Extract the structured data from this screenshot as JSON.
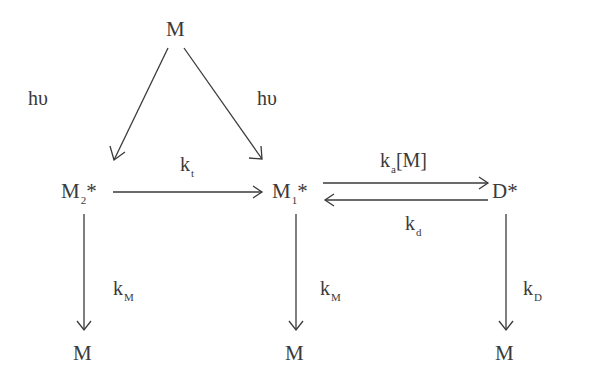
{
  "diagram": {
    "type": "kinetic-scheme",
    "nodes": {
      "ground_top": {
        "label": "M"
      },
      "m2_star": {
        "base": "M",
        "sub": "2",
        "suffix": "*"
      },
      "m1_star": {
        "base": "M",
        "sub": "1",
        "suffix": "*"
      },
      "d_star": {
        "base": "D",
        "suffix": "*"
      },
      "ground_left": {
        "label": "M"
      },
      "ground_mid": {
        "label": "M"
      },
      "ground_right": {
        "label": "M"
      }
    },
    "labels": {
      "hv_left": "hυ",
      "hv_right": "hυ",
      "k_t": {
        "base": "k",
        "sub": "t"
      },
      "k_a": {
        "base": "k",
        "sub": "a",
        "suffix": "[M]"
      },
      "k_d": {
        "base": "k",
        "sub": "d"
      },
      "k_M_left": {
        "base": "k",
        "sub": "M"
      },
      "k_M_mid": {
        "base": "k",
        "sub": "M"
      },
      "k_D": {
        "base": "k",
        "sub": "D"
      }
    },
    "edges": [
      {
        "from": "M",
        "to": "M2*",
        "label": "hυ"
      },
      {
        "from": "M",
        "to": "M1*",
        "label": "hυ"
      },
      {
        "from": "M2*",
        "to": "M1*",
        "label": "k_t"
      },
      {
        "from": "M1*",
        "to": "D*",
        "label": "k_a[M]"
      },
      {
        "from": "D*",
        "to": "M1*",
        "label": "k_d"
      },
      {
        "from": "M2*",
        "to": "M",
        "label": "k_M"
      },
      {
        "from": "M1*",
        "to": "M",
        "label": "k_M"
      },
      {
        "from": "D*",
        "to": "M",
        "label": "k_D"
      }
    ],
    "colors": {
      "ink": "#3a3a3a",
      "background": "#ffffff"
    }
  }
}
